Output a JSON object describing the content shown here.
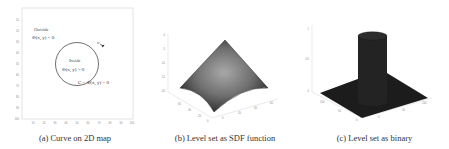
{
  "figure": {
    "panels": [
      {
        "id": "a",
        "caption": "(a) Curve on 2D map",
        "annotations": {
          "outside_label": "Outside",
          "outside_eq": "Φ(x, y) < 0",
          "inside_label": "Inside",
          "inside_eq": "Φ(x, y) > 0",
          "curve_eq": "C = Φ(x, y) = 0",
          "arrow_symbol": "v"
        },
        "axes": {
          "y_ticks": [
            "10",
            "20",
            "30",
            "40",
            "50",
            "60",
            "70",
            "80",
            "90",
            "100"
          ],
          "x_ticks": [
            "10",
            "20",
            "30",
            "40",
            "50",
            "60",
            "70",
            "80",
            "90",
            "100"
          ]
        }
      },
      {
        "id": "b",
        "caption": "(b) Level set as SDF function",
        "axes": {
          "z_ticks": [
            "0",
            "-5",
            "-10",
            "-15",
            "-20"
          ],
          "x_ticks": [
            "0",
            "20",
            "40",
            "60"
          ],
          "y_ticks": [
            "0",
            "20",
            "40",
            "60"
          ]
        }
      },
      {
        "id": "c",
        "caption": "(c) Level set as binary",
        "axes": {
          "z_ticks": [
            "1",
            "0.5",
            "0"
          ],
          "x_ticks": [
            "0",
            "50",
            "100"
          ],
          "y_ticks": [
            "0",
            "50",
            "100"
          ]
        }
      }
    ],
    "colors": {
      "axis": "#bbbbbb",
      "circle": "#333333",
      "surface_dark": "#2a2a2a",
      "surface_light": "#9a9a9a",
      "binary_fill": "#1c1c1c"
    }
  }
}
